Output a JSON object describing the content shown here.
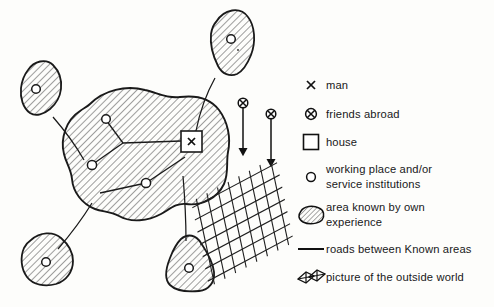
{
  "figure": {
    "type": "conceptual-map-diagram",
    "background_color": "#fdfdfb",
    "ink_color": "#1a1a1a",
    "hatch_color": "#2a2a2a"
  },
  "legend": {
    "items": [
      {
        "icon": "x-mark-icon",
        "label": "man"
      },
      {
        "icon": "circled-x-icon",
        "label": "friends abroad"
      },
      {
        "icon": "square-outline-icon",
        "label": "house"
      },
      {
        "icon": "small-circle-icon",
        "label": "working place and/or\nservice institutions"
      },
      {
        "icon": "hatched-blob-icon",
        "label": "area known by own\nexperience"
      },
      {
        "icon": "line-segment-icon",
        "label": "roads between Known areas"
      },
      {
        "icon": "mesh-parallelogram-icon",
        "label": "picture of the outside world"
      }
    ]
  },
  "map": {
    "areas": [
      {
        "name": "central-known-area",
        "has_house": true,
        "nodes": 3
      },
      {
        "name": "upper-right-known-area",
        "has_house": false,
        "nodes": 1
      },
      {
        "name": "left-known-area",
        "has_house": false,
        "nodes": 1
      },
      {
        "name": "lower-left-known-area",
        "has_house": false,
        "nodes": 1
      },
      {
        "name": "lower-center-known-area",
        "has_house": false,
        "nodes": 1
      }
    ],
    "friends_abroad_markers": 2,
    "outside_world_mesh_count": 1
  }
}
